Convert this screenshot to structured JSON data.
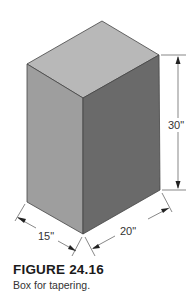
{
  "figure": {
    "title": "FIGURE 24.16",
    "caption": "Box for tapering."
  },
  "box": {
    "colors": {
      "top_face": "#b8b8b8",
      "left_face": "#9e9e9e",
      "right_face": "#6a6a6a",
      "edge": "#444444"
    }
  },
  "dimensions": {
    "height": "30\"",
    "depth": "15\"",
    "width": "20\""
  }
}
